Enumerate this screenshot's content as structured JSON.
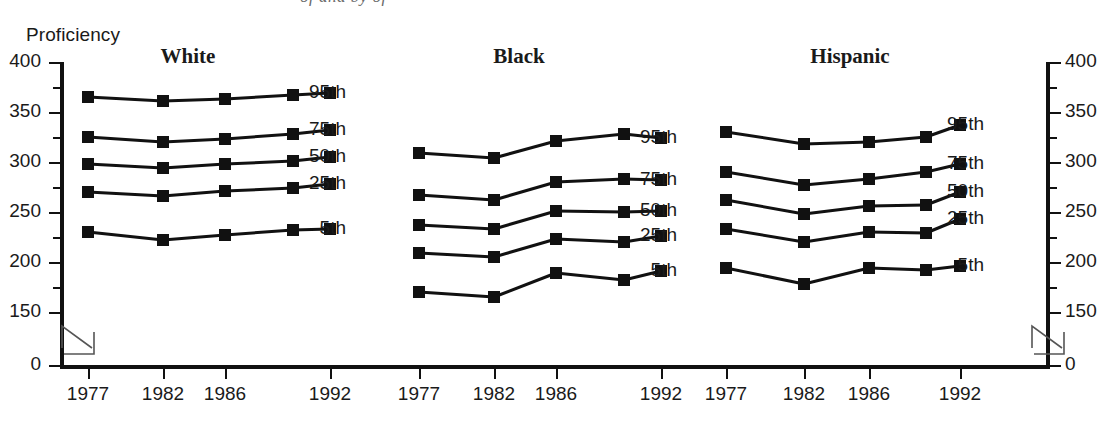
{
  "axis": {
    "y_title": "Proficiency",
    "y_ticks": [
      "400",
      "350",
      "300",
      "250",
      "200",
      "150",
      "0"
    ],
    "y_tick_values": [
      400,
      350,
      300,
      250,
      200,
      150,
      0
    ],
    "x_ticks": [
      "1977",
      "1982",
      "1986",
      "1992"
    ],
    "break_marker": "axis-break"
  },
  "clipped_caption": "of and by of",
  "percentile_labels": [
    "95th",
    "75th",
    "50th",
    "25th",
    "5th"
  ],
  "chart_data": {
    "type": "line",
    "title": "",
    "xlabel": "",
    "ylabel": "Proficiency",
    "ylim": [
      150,
      400
    ],
    "yticks": [
      150,
      200,
      250,
      300,
      350,
      400
    ],
    "grid": false,
    "legend": "inline-right-of-each-panel",
    "x": [
      "1977",
      "1982",
      "1986",
      "1990",
      "1992"
    ],
    "x_tick_labels": [
      "1977",
      "1982",
      "1986",
      "1992"
    ],
    "panels": [
      {
        "name": "White",
        "series": [
          {
            "name": "95th",
            "values": [
              365,
              361,
              363,
              367,
              369
            ]
          },
          {
            "name": "75th",
            "values": [
              325,
              320,
              323,
              328,
              332
            ]
          },
          {
            "name": "50th",
            "values": [
              298,
              294,
              298,
              301,
              305
            ]
          },
          {
            "name": "25th",
            "values": [
              270,
              266,
              271,
              274,
              278
            ]
          },
          {
            "name": "5th",
            "values": [
              230,
              222,
              227,
              232,
              233
            ]
          }
        ]
      },
      {
        "name": "Black",
        "series": [
          {
            "name": "95th",
            "values": [
              309,
              304,
              321,
              328,
              324
            ]
          },
          {
            "name": "75th",
            "values": [
              267,
              262,
              280,
              283,
              282
            ]
          },
          {
            "name": "50th",
            "values": [
              237,
              233,
              251,
              250,
              251
            ]
          },
          {
            "name": "25th",
            "values": [
              209,
              205,
              223,
              220,
              226
            ]
          },
          {
            "name": "5th",
            "values": [
              170,
              165,
              189,
              182,
              191
            ]
          }
        ]
      },
      {
        "name": "Hispanic",
        "series": [
          {
            "name": "95th",
            "values": [
              330,
              318,
              320,
              325,
              337
            ]
          },
          {
            "name": "75th",
            "values": [
              290,
              277,
              283,
              290,
              298
            ]
          },
          {
            "name": "50th",
            "values": [
              262,
              248,
              256,
              257,
              270
            ]
          },
          {
            "name": "25th",
            "values": [
              233,
              220,
              230,
              229,
              243
            ]
          },
          {
            "name": "5th",
            "values": [
              194,
              178,
              194,
              192,
              196
            ]
          }
        ]
      }
    ]
  }
}
